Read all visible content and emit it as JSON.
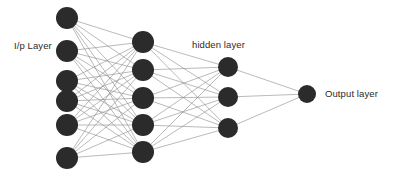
{
  "diagram": {
    "background_color": "#ffffff",
    "node_color": "#2b2b2b",
    "edge_color": "#8c8c8c",
    "text_color": "#2b2b2b",
    "edge_width": 0.6
  },
  "labels": {
    "input_layer": "I/p Layer",
    "hidden_layer": "hidden layer",
    "output_layer": "Output layer"
  },
  "chart_data": {
    "type": "diagram",
    "subtype": "neural-network",
    "layer_count": 4,
    "layers": [
      {
        "name": "I/p Layer",
        "label": "I/p Layer",
        "node_count": 6,
        "x": 67,
        "radius": 11,
        "nodes_y": [
          18,
          51,
          81,
          101,
          125,
          158
        ]
      },
      {
        "name": "hidden-1",
        "label": "",
        "node_count": 5,
        "x": 143,
        "radius": 11,
        "nodes_y": [
          42,
          70,
          98,
          125,
          152
        ]
      },
      {
        "name": "hidden layer",
        "label": "hidden layer",
        "node_count": 3,
        "x": 228,
        "radius": 10,
        "nodes_y": [
          67,
          97,
          128
        ]
      },
      {
        "name": "Output layer",
        "label": "Output layer",
        "node_count": 1,
        "x": 307,
        "radius": 9,
        "nodes_y": [
          94
        ]
      }
    ],
    "connections": [
      {
        "from_layer": 0,
        "to_layer": 1,
        "pattern": "fully-connected",
        "edge_count": 30
      },
      {
        "from_layer": 1,
        "to_layer": 2,
        "pattern": "fully-connected",
        "edge_count": 15
      },
      {
        "from_layer": 2,
        "to_layer": 3,
        "pattern": "fully-connected",
        "edge_count": 3
      }
    ],
    "total_nodes": 15,
    "total_edges": 48
  }
}
